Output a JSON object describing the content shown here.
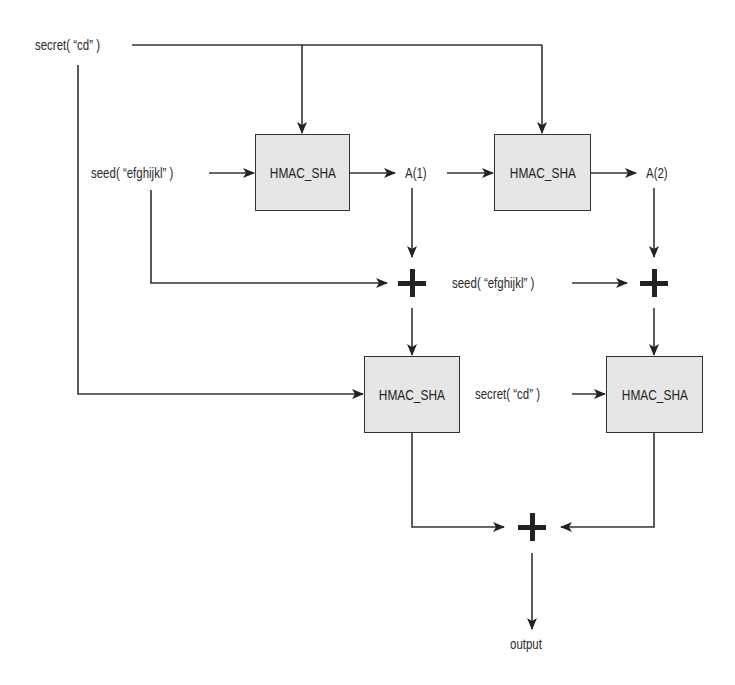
{
  "diagram": {
    "type": "flowchart",
    "title": "",
    "nodes": {
      "secret_top": {
        "label": "secret( “cd” )"
      },
      "seed_left": {
        "label": "seed( “efghijkl” )"
      },
      "hmac1": {
        "label": "HMAC_SHA"
      },
      "a1": {
        "label": "A(1)"
      },
      "hmac2": {
        "label": "HMAC_SHA"
      },
      "a2": {
        "label": "A(2)"
      },
      "plus1": {
        "label": "+"
      },
      "seed_right": {
        "label": "seed( “efghijkl” )"
      },
      "plus2": {
        "label": "+"
      },
      "hmac3": {
        "label": "HMAC_SHA"
      },
      "secret_right": {
        "label": "secret( “cd” )"
      },
      "hmac4": {
        "label": "HMAC_SHA"
      },
      "plus3": {
        "label": "+"
      },
      "output": {
        "label": "output"
      }
    },
    "edges": [
      [
        "secret_top",
        "hmac1"
      ],
      [
        "secret_top",
        "hmac2"
      ],
      [
        "secret_top",
        "hmac3"
      ],
      [
        "seed_left",
        "hmac1"
      ],
      [
        "hmac1",
        "a1"
      ],
      [
        "a1",
        "hmac2"
      ],
      [
        "hmac2",
        "a2"
      ],
      [
        "a1",
        "plus1"
      ],
      [
        "seed_left",
        "plus1"
      ],
      [
        "plus1",
        "hmac3"
      ],
      [
        "a2",
        "plus2"
      ],
      [
        "seed_right",
        "plus2"
      ],
      [
        "plus2",
        "hmac4"
      ],
      [
        "secret_right",
        "hmac4"
      ],
      [
        "hmac3",
        "plus3"
      ],
      [
        "hmac4",
        "plus3"
      ],
      [
        "plus3",
        "output"
      ]
    ],
    "colors": {
      "box_fill": "#e6e6e6",
      "line": "#222222",
      "background": "#ffffff"
    }
  }
}
